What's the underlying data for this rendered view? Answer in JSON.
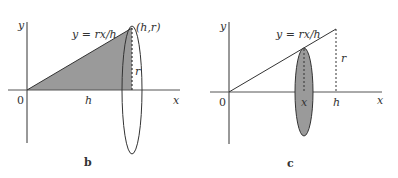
{
  "panels": {
    "b": {
      "caption": "b",
      "y_axis_label": "y",
      "x_axis_label": "x",
      "origin_label": "0",
      "equation": "y = rx/h",
      "apex_label": "(h,r)",
      "radius_label": "r",
      "height_label": "h",
      "shaded_region": "triangle under y = rx/h from 0 to h",
      "colors": {
        "fill": "#9a9a9a",
        "stroke": "#333333"
      }
    },
    "c": {
      "caption": "c",
      "y_axis_label": "y",
      "x_axis_label": "x",
      "origin_label": "0",
      "equation": "y = rx/h",
      "radius_label": "r",
      "slice_label": "x",
      "height_label": "h",
      "shaded_region": "circular cross-section disk at x",
      "colors": {
        "fill": "#9a9a9a",
        "stroke": "#333333"
      }
    }
  }
}
